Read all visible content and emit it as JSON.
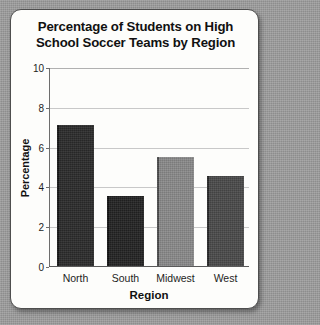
{
  "chart_data": {
    "type": "bar",
    "title": "Percentage of Students on High School Soccer Teams by Region",
    "title_line1": "Percentage of Students on High",
    "title_line2": "School Soccer Teams by Region",
    "xlabel": "Region",
    "ylabel": "Percentage",
    "categories": [
      "North",
      "South",
      "Midwest",
      "West"
    ],
    "values": [
      7.1,
      3.5,
      5.5,
      4.5
    ],
    "bar_colors": [
      "#2b2b2b",
      "#232323",
      "#8a8a8a",
      "#4a4a4a"
    ],
    "ylim": [
      0,
      10
    ],
    "ytick_labels": [
      "0",
      "2",
      "4",
      "6",
      "8",
      "10"
    ],
    "ytick_values": [
      0,
      2,
      4,
      6,
      8,
      10
    ],
    "grid": true,
    "legend": "none"
  },
  "colors": {
    "page_background": "#9c9c9c",
    "card_background": "#fdfdfb",
    "card_border": "#4e4e4e",
    "gridline": "#c8c8c8",
    "axis": "#6d6d6d",
    "text": "#111111"
  }
}
